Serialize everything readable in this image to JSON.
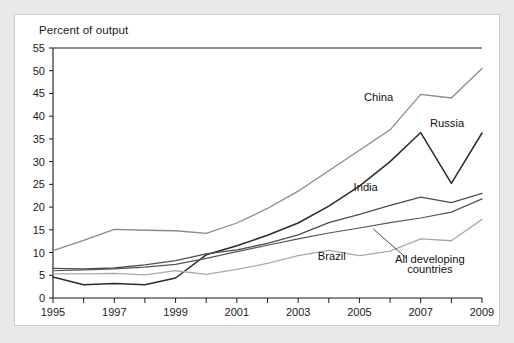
{
  "figure": {
    "title": "Percent of output",
    "background": "#ffffff",
    "frame_color": "#cfcfcf",
    "page_color": "#e9e9e9"
  },
  "chart_data": {
    "type": "line",
    "title": "Percent of output",
    "xlabel": "",
    "ylabel": "Percent of output",
    "xlim": [
      1995,
      2009
    ],
    "ylim": [
      0,
      55
    ],
    "ytick_step": 5,
    "yticks": [
      0,
      5,
      10,
      15,
      20,
      25,
      30,
      35,
      40,
      45,
      50,
      55
    ],
    "ytick_labels": [
      "0",
      "5",
      "10",
      "15",
      "20",
      "25",
      "30",
      "35",
      "40",
      "45",
      "50",
      "55"
    ],
    "x": [
      1995,
      1996,
      1997,
      1998,
      1999,
      2000,
      2001,
      2002,
      2003,
      2004,
      2005,
      2006,
      2007,
      2008,
      2009
    ],
    "xticks": [
      1995,
      1996,
      1997,
      1998,
      1999,
      2000,
      2001,
      2002,
      2003,
      2004,
      2005,
      2006,
      2007,
      2008,
      2009
    ],
    "xtick_labels": [
      "1995",
      "",
      "1997",
      "",
      "1999",
      "",
      "2001",
      "",
      "2003",
      "",
      "2005",
      "",
      "2007",
      "",
      "2009"
    ],
    "grid": false,
    "legend_position": "inline-annotations",
    "series": [
      {
        "name": "China",
        "color": "#8a8a8a",
        "width": 1.3,
        "values": [
          10.4,
          12.7,
          15.1,
          14.9,
          14.8,
          14.2,
          16.5,
          19.7,
          23.5,
          28.0,
          32.5,
          37.0,
          44.8,
          44.0,
          50.5
        ]
      },
      {
        "name": "Russia",
        "color": "#2b2b2b",
        "width": 1.5,
        "values": [
          4.6,
          2.9,
          3.2,
          2.9,
          4.4,
          9.5,
          11.5,
          13.8,
          16.5,
          20.2,
          24.6,
          30.0,
          36.4,
          25.2,
          36.3
        ]
      },
      {
        "name": "India",
        "color": "#4d4d4d",
        "width": 1.3,
        "values": [
          6.5,
          6.4,
          6.6,
          7.3,
          8.2,
          9.7,
          10.6,
          12.0,
          13.9,
          16.6,
          18.4,
          20.4,
          22.2,
          21.0,
          23.0
        ]
      },
      {
        "name": "All developing countries",
        "color": "#555555",
        "width": 1.2,
        "values": [
          6.0,
          6.2,
          6.4,
          6.8,
          7.4,
          8.7,
          10.2,
          11.6,
          13.0,
          14.3,
          15.4,
          16.6,
          17.6,
          18.9,
          21.8
        ]
      },
      {
        "name": "Brazil",
        "color": "#a9a9a9",
        "width": 1.3,
        "values": [
          5.3,
          5.3,
          5.4,
          5.1,
          6.0,
          5.2,
          6.3,
          7.6,
          9.3,
          10.5,
          9.3,
          10.3,
          13.0,
          12.6,
          17.3
        ]
      }
    ],
    "annotations": [
      {
        "text": "China",
        "x": 2006.1,
        "y": 43.3,
        "anchor": "end"
      },
      {
        "text": "Russia",
        "x": 2007.3,
        "y": 37.6,
        "anchor": "start"
      },
      {
        "text": "India",
        "x": 2005.6,
        "y": 23.5,
        "anchor": "end"
      },
      {
        "text": "Brazil",
        "x": 2004.1,
        "y": 8.3,
        "anchor": "middle"
      },
      {
        "text": "All developing",
        "x": 2007.3,
        "y": 7.6,
        "anchor": "middle"
      },
      {
        "text": "countries",
        "x": 2007.3,
        "y": 5.6,
        "anchor": "middle"
      }
    ]
  }
}
